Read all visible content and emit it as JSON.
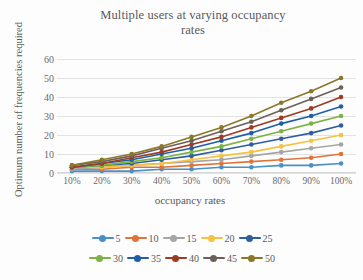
{
  "chart_data": {
    "type": "line",
    "title": "Multiple users at varying occupancy rates",
    "title_line1": "Multiple users at varying occupancy",
    "title_line2": "rates",
    "xlabel": "occupancy rates",
    "ylabel": "Optimum number of frequencies required",
    "categories": [
      "10%",
      "20%",
      "30%",
      "40%",
      "50%",
      "60%",
      "70%",
      "80%",
      "90%",
      "100%"
    ],
    "x": [
      10,
      20,
      30,
      40,
      50,
      60,
      70,
      80,
      90,
      100
    ],
    "ylim": [
      0,
      60
    ],
    "yticks": [
      0,
      10,
      20,
      30,
      40,
      50,
      60
    ],
    "grid": true,
    "legend_position": "bottom",
    "series": [
      {
        "name": "5",
        "color": "#4a90c4",
        "values": [
          1,
          1,
          1,
          2,
          2,
          3,
          3,
          4,
          4,
          5
        ]
      },
      {
        "name": "10",
        "color": "#e0733a",
        "values": [
          2,
          2,
          3,
          3,
          4,
          5,
          6,
          7,
          8,
          10
        ]
      },
      {
        "name": "15",
        "color": "#a5a5a5",
        "values": [
          2,
          3,
          4,
          5,
          6,
          7,
          9,
          11,
          13,
          15
        ]
      },
      {
        "name": "20",
        "color": "#f5c243",
        "values": [
          3,
          3,
          4,
          5,
          7,
          9,
          11,
          14,
          17,
          20
        ]
      },
      {
        "name": "25",
        "color": "#2e5e9e",
        "values": [
          3,
          4,
          5,
          7,
          9,
          12,
          15,
          18,
          21,
          25
        ]
      },
      {
        "name": "30",
        "color": "#7cb342",
        "values": [
          3,
          4,
          6,
          8,
          11,
          14,
          18,
          22,
          26,
          30
        ]
      },
      {
        "name": "35",
        "color": "#1f5fa8",
        "values": [
          3,
          5,
          7,
          10,
          13,
          17,
          21,
          26,
          30,
          35
        ]
      },
      {
        "name": "40",
        "color": "#9e3b23",
        "values": [
          3,
          5,
          8,
          11,
          15,
          19,
          24,
          29,
          34,
          40
        ]
      },
      {
        "name": "45",
        "color": "#6b6157",
        "values": [
          4,
          6,
          9,
          13,
          17,
          22,
          27,
          33,
          39,
          45
        ]
      },
      {
        "name": "50",
        "color": "#8a7828",
        "values": [
          4,
          7,
          10,
          14,
          19,
          24,
          30,
          37,
          43,
          50
        ]
      }
    ]
  },
  "legend": {
    "rows": [
      [
        "5",
        "10",
        "15",
        "20",
        "25"
      ],
      [
        "30",
        "35",
        "40",
        "45",
        "50"
      ]
    ]
  }
}
